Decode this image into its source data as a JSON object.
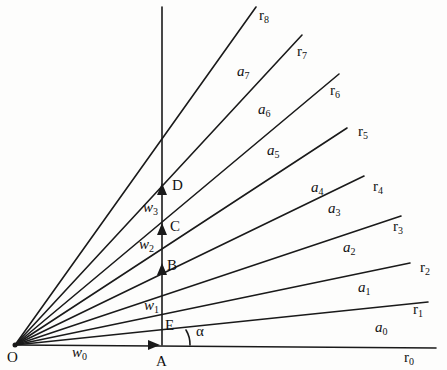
{
  "diagram": {
    "origin": {
      "label": "O",
      "x": 15,
      "y": 345
    },
    "rays": [
      {
        "name": "r0",
        "sub": "0",
        "x2": 436,
        "y2": 348,
        "lx": 404,
        "ly": 362
      },
      {
        "name": "r1",
        "sub": "1",
        "x2": 428,
        "y2": 302,
        "lx": 413,
        "ly": 314
      },
      {
        "name": "r2",
        "sub": "2",
        "x2": 410,
        "y2": 263,
        "lx": 420,
        "ly": 272
      },
      {
        "name": "r3",
        "sub": "3",
        "x2": 401,
        "y2": 216,
        "lx": 393,
        "ly": 231
      },
      {
        "name": "r4",
        "sub": "4",
        "x2": 364,
        "y2": 176,
        "lx": 373,
        "ly": 191
      },
      {
        "name": "r5",
        "sub": "5",
        "x2": 347,
        "y2": 128,
        "lx": 358,
        "ly": 136
      },
      {
        "name": "r6",
        "sub": "6",
        "x2": 339,
        "y2": 74,
        "lx": 330,
        "ly": 95
      },
      {
        "name": "r7",
        "sub": "7",
        "x2": 302,
        "y2": 35,
        "lx": 297,
        "ly": 56
      },
      {
        "name": "r8",
        "sub": "8",
        "x2": 256,
        "y2": 7,
        "lx": 259,
        "ly": 20
      }
    ],
    "regions": [
      {
        "name": "a0",
        "sub": "0",
        "x": 375,
        "y": 332
      },
      {
        "name": "a1",
        "sub": "1",
        "x": 358,
        "y": 292
      },
      {
        "name": "a2",
        "sub": "2",
        "x": 343,
        "y": 252
      },
      {
        "name": "a3",
        "sub": "3",
        "x": 328,
        "y": 213
      },
      {
        "name": "a4",
        "sub": "4",
        "x": 311,
        "y": 192
      },
      {
        "name": "a5",
        "sub": "5",
        "x": 267,
        "y": 155
      },
      {
        "name": "a6",
        "sub": "6",
        "x": 258,
        "y": 114
      },
      {
        "name": "a7",
        "sub": "7",
        "x": 237,
        "y": 76
      }
    ],
    "vertical_line": {
      "x": 162,
      "y1": 7,
      "y2": 345
    },
    "points": [
      {
        "label": "A",
        "x": 156,
        "y": 366
      },
      {
        "label": "B",
        "x": 167,
        "y": 270
      },
      {
        "label": "C",
        "x": 170,
        "y": 231
      },
      {
        "label": "D",
        "x": 172,
        "y": 190
      },
      {
        "label": "E",
        "x": 165,
        "y": 330
      }
    ],
    "vectors": [
      {
        "label": "w",
        "sub": "0",
        "x": 72,
        "y": 357
      },
      {
        "label": "w",
        "sub": "1",
        "x": 144,
        "y": 310
      },
      {
        "label": "w",
        "sub": "2",
        "x": 139,
        "y": 249
      },
      {
        "label": "w",
        "sub": "3",
        "x": 143,
        "y": 212
      }
    ],
    "arrowheads": [
      {
        "name": "arrow-A",
        "dir": "right",
        "x": 158,
        "y": 345
      },
      {
        "name": "arrow-B",
        "dir": "up",
        "x": 162,
        "y": 265
      },
      {
        "name": "arrow-C",
        "dir": "up",
        "x": 162,
        "y": 225
      },
      {
        "name": "arrow-D",
        "dir": "up",
        "x": 162,
        "y": 185
      }
    ],
    "angle": {
      "label": "α",
      "x": 196,
      "y": 336
    },
    "stroke_color": "#1a1a1a"
  }
}
